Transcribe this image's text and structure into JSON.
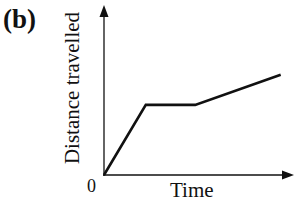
{
  "figure": {
    "panel_label": "(b)",
    "origin_label": "0"
  },
  "chart_data": {
    "type": "line",
    "title": "",
    "panel": "(b)",
    "xlabel": "Time",
    "ylabel": "Distance travelled",
    "origin_label": "0",
    "grid": false,
    "legend": null,
    "xlim": [
      0,
      10
    ],
    "ylim": [
      0,
      10
    ],
    "series": [
      {
        "name": "distance",
        "x": [
          0,
          2.2,
          4.8,
          9.3
        ],
        "y": [
          0,
          4.2,
          4.2,
          6.0
        ]
      }
    ],
    "segments": [
      "steep constant-speed increase",
      "flat (stationary)",
      "gentler constant-speed increase"
    ]
  }
}
